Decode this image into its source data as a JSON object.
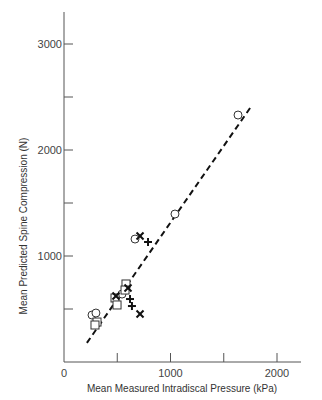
{
  "chart_data": {
    "type": "scatter",
    "title": "",
    "xlabel": "Mean Measured Intradiscal Pressure (kPa)",
    "ylabel": "Mean Predicted Spine Compression (N)",
    "xlim": [
      0,
      2200
    ],
    "ylim": [
      0,
      3300
    ],
    "x_ticks": [
      0,
      500,
      1000,
      1500,
      2000
    ],
    "x_tick_labels": [
      "0",
      "",
      "1000",
      "",
      "2000"
    ],
    "y_ticks": [
      0,
      500,
      1000,
      1500,
      2000,
      2500,
      3000
    ],
    "y_tick_labels": [
      "",
      "",
      "1000",
      "",
      "2000",
      "",
      "3000"
    ],
    "grid": false,
    "legend": null,
    "series": [
      {
        "name": "circle",
        "marker": "circle",
        "points": [
          [
            1634,
            2330
          ],
          [
            1042,
            1396
          ],
          [
            667,
            1160
          ],
          [
            545,
            641
          ],
          [
            263,
            443
          ],
          [
            300,
            462
          ]
        ]
      },
      {
        "name": "square",
        "marker": "square",
        "points": [
          [
            582,
            736
          ],
          [
            573,
            679
          ],
          [
            479,
            604
          ],
          [
            498,
            538
          ],
          [
            310,
            377
          ],
          [
            291,
            349
          ]
        ]
      },
      {
        "name": "cross-x",
        "marker": "x",
        "points": [
          [
            714,
            1189
          ],
          [
            601,
            698
          ],
          [
            488,
            623
          ],
          [
            714,
            453
          ]
        ]
      },
      {
        "name": "cross-plus",
        "marker": "plus",
        "points": [
          [
            789,
            1132
          ],
          [
            620,
            594
          ],
          [
            638,
            528
          ]
        ]
      }
    ],
    "fit_line": {
      "style": "dashed",
      "from": [
        215,
        180
      ],
      "to": [
        1750,
        2400
      ]
    }
  }
}
